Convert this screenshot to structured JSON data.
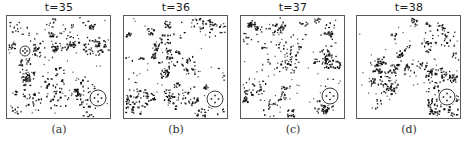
{
  "figure": {
    "panels": [
      {
        "id": "a",
        "title": "t=35",
        "caption": "(a)",
        "left": 6,
        "seed": 35,
        "markers": [
          {
            "cx": 18,
            "cy": 35,
            "r": 5,
            "style": "small"
          },
          {
            "cx": 91,
            "cy": 82,
            "r": 8,
            "style": "dots"
          }
        ]
      },
      {
        "id": "b",
        "title": "t=36",
        "caption": "(b)",
        "left": 123,
        "seed": 36,
        "markers": [
          {
            "cx": 91,
            "cy": 83,
            "r": 8,
            "style": "cross"
          }
        ]
      },
      {
        "id": "c",
        "title": "t=37",
        "caption": "(c)",
        "left": 240,
        "seed": 37,
        "markers": [
          {
            "cx": 89,
            "cy": 80,
            "r": 8,
            "style": "dots"
          }
        ]
      },
      {
        "id": "d",
        "title": "t=38",
        "caption": "(d)",
        "left": 356,
        "seed": 38,
        "markers": [
          {
            "cx": 90,
            "cy": 81,
            "r": 8,
            "style": "cross"
          }
        ]
      }
    ],
    "colors": {
      "cell": "#111111",
      "cell_light": "#555555",
      "frame": "#5a5a5a",
      "background": "#ffffff"
    }
  }
}
